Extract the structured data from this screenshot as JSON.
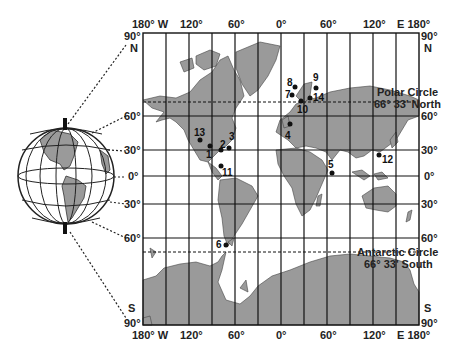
{
  "map": {
    "longitude_labels_top": [
      "180° W",
      "120°",
      "60°",
      "0°",
      "60°",
      "120°",
      "E 180°"
    ],
    "longitude_labels_bottom": [
      "180° W",
      "120°",
      "60°",
      "0°",
      "60°",
      "120°",
      "E 180°"
    ],
    "latitude_labels_left": [
      "90°",
      "N",
      "60°",
      "30°",
      "0°",
      "30°",
      "60°",
      "S",
      "90°"
    ],
    "latitude_labels_right": [
      "90°",
      "N",
      "60°",
      "30°",
      "0°",
      "30°",
      "60°",
      "S",
      "90°"
    ],
    "polar_circle": {
      "line1": "Polar Circle",
      "line2": "66° 33' North"
    },
    "antarctic_circle": {
      "line1": "Antarctic Circle",
      "line2": "66° 33' South"
    },
    "sites": [
      {
        "id": "1",
        "label": "1"
      },
      {
        "id": "2",
        "label": "2"
      },
      {
        "id": "3",
        "label": "3"
      },
      {
        "id": "4",
        "label": "4"
      },
      {
        "id": "5",
        "label": "5"
      },
      {
        "id": "6",
        "label": "6"
      },
      {
        "id": "7",
        "label": "7"
      },
      {
        "id": "8",
        "label": "8"
      },
      {
        "id": "9",
        "label": "9"
      },
      {
        "id": "10",
        "label": "10"
      },
      {
        "id": "11",
        "label": "11"
      },
      {
        "id": "12",
        "label": "12"
      },
      {
        "id": "13",
        "label": "13"
      },
      {
        "id": "14",
        "label": "14"
      }
    ],
    "colors": {
      "land": "#9a9a9a",
      "line": "#222222",
      "water": "#ffffff"
    }
  }
}
